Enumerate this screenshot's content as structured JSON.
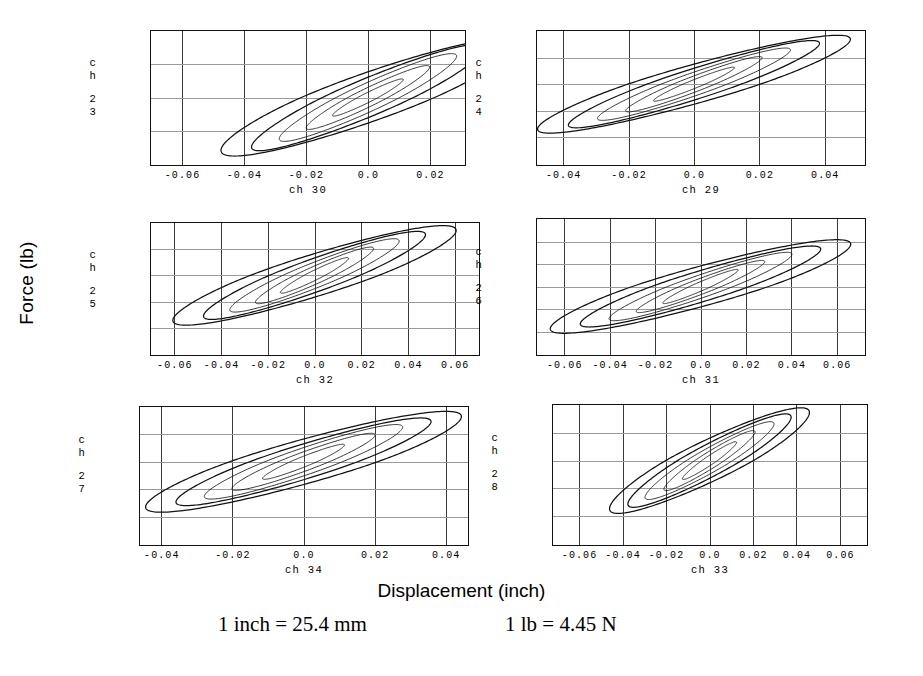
{
  "figure": {
    "y_axis_title": "Force (lb)",
    "x_axis_title": "Displacement (inch)",
    "footnote_left": "1 inch = 25.4 mm",
    "footnote_right": "1 lb = 4.45 N"
  },
  "chart_data": {
    "type": "line",
    "title": "",
    "xlabel": "Displacement (inch)",
    "ylabel": "Force (lb)",
    "grid": true,
    "legend": "none",
    "annotations": [
      "1 inch = 25.4 mm",
      "1 lb = 4.45 N"
    ],
    "panels": [
      {
        "id": "panel-ch30",
        "position": "top-left",
        "xlabel": "ch 30",
        "ylabel": "ch 23",
        "ylabel_chars": [
          "c",
          "h",
          "2",
          "3"
        ],
        "xlim": [
          -0.07,
          0.031
        ],
        "ylim": [
          -100,
          100
        ],
        "xticks": [
          -0.06,
          -0.04,
          -0.02,
          0.0,
          0.02
        ],
        "xticklabels": [
          "-0.06",
          "-0.04",
          "-0.02",
          "0.0",
          "0.02"
        ],
        "yticks": [
          100,
          50,
          0,
          -50,
          -100
        ],
        "yticklabels": [
          "100",
          "50",
          "0",
          "-50",
          "-100"
        ],
        "loops": [
          {
            "name": "cycle-1",
            "x_amplitude": 0.011,
            "y_amplitude": 28,
            "slope_ratio": 0.72,
            "openness": 0.3
          },
          {
            "name": "cycle-2",
            "x_amplitude": 0.019,
            "y_amplitude": 48,
            "slope_ratio": 0.74,
            "openness": 0.34
          },
          {
            "name": "cycle-3",
            "x_amplitude": 0.027,
            "y_amplitude": 66,
            "slope_ratio": 0.76,
            "openness": 0.38
          },
          {
            "name": "cycle-4",
            "x_amplitude": 0.035,
            "y_amplitude": 80,
            "slope_ratio": 0.78,
            "openness": 0.42
          },
          {
            "name": "cycle-5",
            "x_amplitude": 0.043,
            "y_amplitude": 88,
            "slope_ratio": 0.8,
            "openness": 0.5
          }
        ]
      },
      {
        "id": "panel-ch29",
        "position": "top-right",
        "xlabel": "ch 29",
        "ylabel": "ch 24",
        "ylabel_chars": [
          "c",
          "h",
          "2",
          "4"
        ],
        "xlim": [
          -0.048,
          0.052
        ],
        "ylim": [
          -150,
          100
        ],
        "xticks": [
          -0.04,
          -0.02,
          0.0,
          0.02,
          0.04
        ],
        "xticklabels": [
          "-0.04",
          "-0.02",
          "0.0",
          "0.02",
          "0.04"
        ],
        "yticks": [
          100,
          50,
          0,
          -50,
          -100,
          -150
        ],
        "yticklabels": [
          "100",
          "50",
          "0",
          "-50",
          "-100",
          "-150"
        ],
        "loops": [
          {
            "name": "cycle-1",
            "x_amplitude": 0.012,
            "y_amplitude": 32,
            "slope_ratio": 0.74,
            "openness": 0.28
          },
          {
            "name": "cycle-2",
            "x_amplitude": 0.02,
            "y_amplitude": 52,
            "slope_ratio": 0.76,
            "openness": 0.32
          },
          {
            "name": "cycle-3",
            "x_amplitude": 0.028,
            "y_amplitude": 68,
            "slope_ratio": 0.78,
            "openness": 0.36
          },
          {
            "name": "cycle-4",
            "x_amplitude": 0.036,
            "y_amplitude": 82,
            "slope_ratio": 0.8,
            "openness": 0.4
          },
          {
            "name": "cycle-5",
            "x_amplitude": 0.044,
            "y_amplitude": 92,
            "slope_ratio": 0.82,
            "openness": 0.46
          }
        ]
      },
      {
        "id": "panel-ch32",
        "position": "middle-left",
        "xlabel": "ch 32",
        "ylabel": "ch 25",
        "ylabel_chars": [
          "c",
          "h",
          "2",
          "5"
        ],
        "xlim": [
          -0.07,
          0.07
        ],
        "ylim": [
          -150,
          100
        ],
        "xticks": [
          -0.06,
          -0.04,
          -0.02,
          0.0,
          0.02,
          0.04,
          0.06
        ],
        "xticklabels": [
          "-0.06",
          "-0.04",
          "-0.02",
          "0.0",
          "0.02",
          "0.04",
          "0.06"
        ],
        "yticks": [
          100,
          50,
          0,
          -50,
          -100,
          -150
        ],
        "yticklabels": [
          "100",
          "50",
          "0",
          "-50",
          "-100",
          "-150"
        ],
        "loops": [
          {
            "name": "cycle-1",
            "x_amplitude": 0.014,
            "y_amplitude": 34,
            "slope_ratio": 0.72,
            "openness": 0.32
          },
          {
            "name": "cycle-2",
            "x_amplitude": 0.024,
            "y_amplitude": 54,
            "slope_ratio": 0.74,
            "openness": 0.36
          },
          {
            "name": "cycle-3",
            "x_amplitude": 0.034,
            "y_amplitude": 70,
            "slope_ratio": 0.76,
            "openness": 0.4
          },
          {
            "name": "cycle-4",
            "x_amplitude": 0.044,
            "y_amplitude": 84,
            "slope_ratio": 0.78,
            "openness": 0.44
          },
          {
            "name": "cycle-5",
            "x_amplitude": 0.055,
            "y_amplitude": 95,
            "slope_ratio": 0.8,
            "openness": 0.5
          }
        ]
      },
      {
        "id": "panel-ch31",
        "position": "middle-right",
        "xlabel": "ch 31",
        "ylabel": "ch 26",
        "ylabel_chars": [
          "c",
          "h",
          "2",
          "6"
        ],
        "xlim": [
          -0.072,
          0.072
        ],
        "ylim": [
          -150,
          150
        ],
        "xticks": [
          -0.06,
          -0.04,
          -0.02,
          0.0,
          0.02,
          0.04,
          0.06
        ],
        "xticklabels": [
          "-0.06",
          "-0.04",
          "-0.02",
          "0.0",
          "0.02",
          "0.04",
          "0.06"
        ],
        "yticks": [
          150,
          100,
          50,
          0,
          -50,
          -100,
          -150
        ],
        "yticklabels": [
          "150",
          "100",
          "50",
          "0",
          "-50",
          "-100",
          "-150"
        ],
        "loops": [
          {
            "name": "cycle-1",
            "x_amplitude": 0.016,
            "y_amplitude": 38,
            "slope_ratio": 0.72,
            "openness": 0.3
          },
          {
            "name": "cycle-2",
            "x_amplitude": 0.027,
            "y_amplitude": 58,
            "slope_ratio": 0.74,
            "openness": 0.34
          },
          {
            "name": "cycle-3",
            "x_amplitude": 0.038,
            "y_amplitude": 76,
            "slope_ratio": 0.76,
            "openness": 0.38
          },
          {
            "name": "cycle-4",
            "x_amplitude": 0.049,
            "y_amplitude": 90,
            "slope_ratio": 0.78,
            "openness": 0.44
          },
          {
            "name": "cycle-5",
            "x_amplitude": 0.06,
            "y_amplitude": 104,
            "slope_ratio": 0.8,
            "openness": 0.5
          }
        ]
      },
      {
        "id": "panel-ch34",
        "position": "bottom-left",
        "xlabel": "ch 34",
        "ylabel": "ch 27",
        "ylabel_chars": [
          "c",
          "h",
          "2",
          "7"
        ],
        "xlim": [
          -0.046,
          0.046
        ],
        "ylim": [
          -150,
          100
        ],
        "xticks": [
          -0.04,
          -0.02,
          0.0,
          0.02,
          0.04
        ],
        "xticklabels": [
          "-0.04",
          "-0.02",
          "0.0",
          "0.02",
          "0.04"
        ],
        "yticks": [
          100,
          50,
          0,
          -50,
          -100,
          -150
        ],
        "yticklabels": [
          "100",
          "50",
          "0",
          "-50",
          "-100",
          "-150"
        ],
        "loops": [
          {
            "name": "cycle-1",
            "x_amplitude": 0.011,
            "y_amplitude": 32,
            "slope_ratio": 0.7,
            "openness": 0.34
          },
          {
            "name": "cycle-2",
            "x_amplitude": 0.019,
            "y_amplitude": 52,
            "slope_ratio": 0.72,
            "openness": 0.38
          },
          {
            "name": "cycle-3",
            "x_amplitude": 0.026,
            "y_amplitude": 68,
            "slope_ratio": 0.74,
            "openness": 0.42
          },
          {
            "name": "cycle-4",
            "x_amplitude": 0.033,
            "y_amplitude": 80,
            "slope_ratio": 0.76,
            "openness": 0.46
          },
          {
            "name": "cycle-5",
            "x_amplitude": 0.04,
            "y_amplitude": 92,
            "slope_ratio": 0.78,
            "openness": 0.52
          }
        ]
      },
      {
        "id": "panel-ch33",
        "position": "bottom-right",
        "xlabel": "ch 33",
        "ylabel": "ch 28",
        "ylabel_chars": [
          "c",
          "h",
          "2",
          "8"
        ],
        "xlim": [
          -0.072,
          0.072
        ],
        "ylim": [
          -150,
          100
        ],
        "xticks": [
          -0.06,
          -0.04,
          -0.02,
          0.0,
          0.02,
          0.04,
          0.06
        ],
        "xticklabels": [
          "-0.06",
          "-0.04",
          "-0.02",
          "0.0",
          "0.02",
          "0.04",
          "0.06"
        ],
        "yticks": [
          100,
          50,
          0,
          -50,
          -100,
          -150
        ],
        "yticklabels": [
          "100",
          "50",
          "0",
          "-50",
          "-100",
          "-150"
        ],
        "loops": [
          {
            "name": "cycle-1",
            "x_amplitude": 0.012,
            "y_amplitude": 34,
            "slope_ratio": 0.76,
            "openness": 0.3
          },
          {
            "name": "cycle-2",
            "x_amplitude": 0.02,
            "y_amplitude": 54,
            "slope_ratio": 0.78,
            "openness": 0.34
          },
          {
            "name": "cycle-3",
            "x_amplitude": 0.028,
            "y_amplitude": 70,
            "slope_ratio": 0.8,
            "openness": 0.38
          },
          {
            "name": "cycle-4",
            "x_amplitude": 0.035,
            "y_amplitude": 84,
            "slope_ratio": 0.82,
            "openness": 0.42
          },
          {
            "name": "cycle-5",
            "x_amplitude": 0.042,
            "y_amplitude": 95,
            "slope_ratio": 0.84,
            "openness": 0.48
          }
        ]
      }
    ]
  },
  "layout": {
    "panel_boxes": [
      {
        "id": "panel-ch30",
        "left": 150,
        "top": 30,
        "width": 316,
        "height": 136
      },
      {
        "id": "panel-ch29",
        "left": 536,
        "top": 30,
        "width": 330,
        "height": 136
      },
      {
        "id": "panel-ch32",
        "left": 150,
        "top": 222,
        "width": 330,
        "height": 134
      },
      {
        "id": "panel-ch31",
        "left": 536,
        "top": 218,
        "width": 330,
        "height": 138
      },
      {
        "id": "panel-ch34",
        "left": 139,
        "top": 406,
        "width": 330,
        "height": 140
      },
      {
        "id": "panel-ch33",
        "left": 552,
        "top": 404,
        "width": 316,
        "height": 142
      }
    ]
  }
}
